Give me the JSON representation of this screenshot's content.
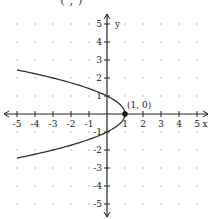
{
  "top_fragment": "(  ,  )",
  "chart_data": {
    "type": "line",
    "title": "",
    "xlabel": "x",
    "ylabel": "y",
    "xlim": [
      -5,
      5
    ],
    "ylim": [
      -5,
      5
    ],
    "grid": "dots",
    "x_ticks": [
      "-5",
      "-4",
      "-3",
      "-2",
      "-1",
      "1",
      "2",
      "3",
      "4",
      "5"
    ],
    "y_ticks": [
      "5",
      "4",
      "3",
      "2",
      "1",
      "-1",
      "-2",
      "-3",
      "-4",
      "-5"
    ],
    "series": [
      {
        "name": "x = 1 - y^2",
        "points": [
          [
            -5,
            2.45
          ],
          [
            -3,
            2
          ],
          [
            -1.25,
            1.5
          ],
          [
            0,
            1
          ],
          [
            0.75,
            0.5
          ],
          [
            1,
            0
          ],
          [
            0.75,
            -0.5
          ],
          [
            0,
            -1
          ],
          [
            -1.25,
            -1.5
          ],
          [
            -3,
            -2
          ],
          [
            -5,
            -2.45
          ]
        ]
      }
    ],
    "annotations": [
      {
        "text": "(1, 0)",
        "x": 1,
        "y": 0,
        "marker": "filled-dot"
      }
    ]
  }
}
